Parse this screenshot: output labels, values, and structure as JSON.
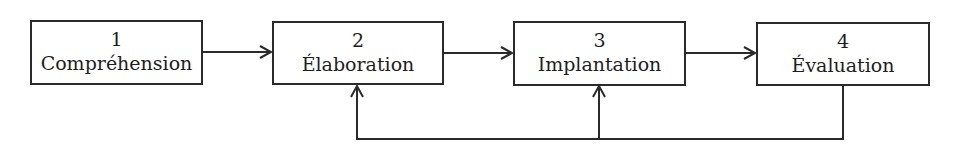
{
  "diagram": {
    "steps": [
      {
        "number": "1",
        "label": "Compréhension"
      },
      {
        "number": "2",
        "label": "Élaboration"
      },
      {
        "number": "3",
        "label": "Implantation"
      },
      {
        "number": "4",
        "label": "Évaluation"
      }
    ],
    "arrows": [
      {
        "from": "1",
        "to": "2",
        "type": "forward"
      },
      {
        "from": "2",
        "to": "3",
        "type": "forward"
      },
      {
        "from": "3",
        "to": "4",
        "type": "forward"
      },
      {
        "from": "4",
        "to": "2",
        "type": "feedback"
      },
      {
        "from": "4",
        "to": "3",
        "type": "feedback"
      }
    ],
    "colors": {
      "line": "#2a2a2a",
      "background": "#ffffff"
    }
  }
}
